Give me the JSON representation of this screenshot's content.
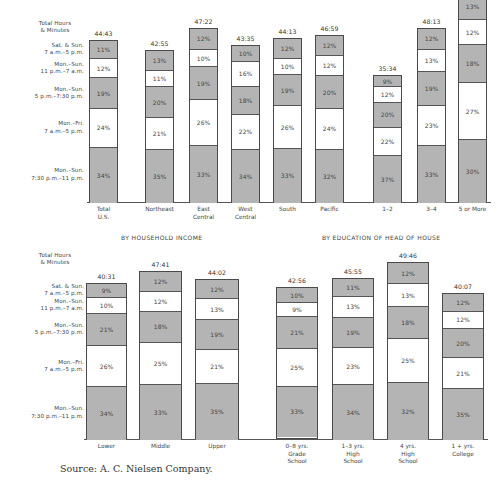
{
  "row_labels": {
    "header": [
      "Total Hours",
      "& Minutes"
    ],
    "segments": [
      [
        "Sat. & Sun.",
        "7 a.m.–5 p.m."
      ],
      [
        "Mon.–Sun.",
        "11 p.m.–7 a.m."
      ],
      [
        "Mon.–Sun.",
        "5 p.m.–7:30 p.m."
      ],
      [
        "Mon.–Fri.",
        "7 a.m.–5 p.m."
      ],
      [
        "Mon.–Sun.",
        "7:30 p.m.–11 p.m."
      ]
    ]
  },
  "sections": {
    "income": "BY HOUSEHOLD INCOME",
    "education": "BY EDUCATION OF HEAD OF HOUSE"
  },
  "source": "Source: A. C. Nielsen Company.",
  "chart_data": [
    {
      "type": "bar",
      "stacked": true,
      "title": "Television viewing hours by region and household size",
      "ylabel": "Total Hours & Minutes",
      "segment_order_top_to_bottom": [
        "Sat. & Sun. 7 a.m.–5 p.m.",
        "Mon.–Sun. 11 p.m.–7 a.m.",
        "Mon.–Sun. 5 p.m.–7:30 p.m.",
        "Mon.–Fri. 7 a.m.–5 p.m.",
        "Mon.–Sun. 7:30 p.m.–11 p.m."
      ],
      "categories": [
        "Total U.S.",
        "Northeast",
        "East Central",
        "West Central",
        "South",
        "Pacific",
        "1–2",
        "3–4",
        "5 or More"
      ],
      "totals": [
        "44:43",
        "42:55",
        "47:22",
        "43:35",
        "44:13",
        "46:59",
        "35:34",
        "48:13",
        ""
      ],
      "series": [
        {
          "name": "Sat. & Sun. 7 a.m.–5 p.m.",
          "values": [
            11,
            13,
            12,
            10,
            12,
            12,
            9,
            12,
            13
          ]
        },
        {
          "name": "Mon.–Sun. 11 p.m.–7 a.m.",
          "values": [
            12,
            11,
            10,
            16,
            10,
            12,
            12,
            13,
            12
          ]
        },
        {
          "name": "Mon.–Sun. 5 p.m.–7:30 p.m.",
          "values": [
            19,
            20,
            19,
            18,
            19,
            20,
            20,
            19,
            18
          ]
        },
        {
          "name": "Mon.–Fri. 7 a.m.–5 p.m.",
          "values": [
            24,
            21,
            26,
            22,
            26,
            24,
            22,
            23,
            27
          ]
        },
        {
          "name": "Mon.–Sun. 7:30 p.m.–11 p.m.",
          "values": [
            34,
            35,
            33,
            34,
            33,
            32,
            37,
            33,
            30
          ]
        }
      ],
      "colors": {
        "gray": "#b4b4b4",
        "white": "#ffffff"
      }
    },
    {
      "type": "bar",
      "stacked": true,
      "title": "Television viewing hours by household income and by education of head of house",
      "ylabel": "Total Hours & Minutes",
      "groups": {
        "BY HOUSEHOLD INCOME": [
          "Lower",
          "Middle",
          "Upper"
        ],
        "BY EDUCATION OF HEAD OF HOUSE": [
          "0–8 yrs. Grade School",
          "1–3 yrs. High School",
          "4 yrs. High School",
          "1 + yrs. College"
        ]
      },
      "categories": [
        "Lower",
        "Middle",
        "Upper",
        "0–8 yrs. Grade School",
        "1–3 yrs. High School",
        "4 yrs. High School",
        "1 + yrs. College"
      ],
      "totals": [
        "40:31",
        "47:41",
        "44:02",
        "42:56",
        "45:55",
        "49:46",
        "40:07"
      ],
      "series": [
        {
          "name": "Sat. & Sun. 7 a.m.–5 p.m.",
          "values": [
            9,
            12,
            12,
            10,
            11,
            12,
            12
          ]
        },
        {
          "name": "Mon.–Sun. 11 p.m.–7 a.m.",
          "values": [
            10,
            12,
            13,
            9,
            13,
            13,
            12
          ]
        },
        {
          "name": "Mon.–Sun. 5 p.m.–7:30 p.m.",
          "values": [
            21,
            18,
            19,
            21,
            19,
            18,
            20
          ]
        },
        {
          "name": "Mon.–Fri. 7 a.m.–5 p.m.",
          "values": [
            26,
            25,
            21,
            25,
            23,
            25,
            21
          ]
        },
        {
          "name": "Mon.–Sun. 7:30 p.m.–11 p.m.",
          "values": [
            34,
            33,
            35,
            33,
            34,
            32,
            35
          ]
        }
      ],
      "colors": {
        "gray": "#b4b4b4",
        "white": "#ffffff"
      }
    }
  ],
  "layout": {
    "top": {
      "baseline": 202,
      "bars": [
        {
          "x": 89,
          "w": 29,
          "top": 40,
          "label": [
            "Total",
            "U.S."
          ]
        },
        {
          "x": 145,
          "w": 29,
          "top": 50,
          "label": [
            "Northeast"
          ]
        },
        {
          "x": 189,
          "w": 29,
          "top": 28,
          "label": [
            "East",
            "Central"
          ]
        },
        {
          "x": 231,
          "w": 29,
          "top": 45,
          "label": [
            "West",
            "Central"
          ]
        },
        {
          "x": 273,
          "w": 29,
          "top": 38,
          "label": [
            "South"
          ]
        },
        {
          "x": 315,
          "w": 29,
          "top": 35,
          "label": [
            "Pacific"
          ]
        },
        {
          "x": 373,
          "w": 29,
          "top": 75,
          "label": [
            "1–2"
          ]
        },
        {
          "x": 417,
          "w": 29,
          "top": 28,
          "label": [
            "3–4"
          ]
        },
        {
          "x": 458,
          "w": 29,
          "top": -8,
          "label": [
            "5 or More"
          ]
        }
      ],
      "row_label_y": [
        37,
        52,
        66,
        92,
        148,
        177
      ],
      "row_label_header_y": 20
    },
    "bottom": {
      "baseline": 439,
      "bars": [
        {
          "x": 86,
          "w": 41,
          "top": 283,
          "label": [
            "Lower"
          ]
        },
        {
          "x": 139,
          "w": 43,
          "top": 271,
          "label": [
            "Middle"
          ]
        },
        {
          "x": 195,
          "w": 44,
          "top": 279,
          "label": [
            "Upper"
          ]
        },
        {
          "x": 276,
          "w": 42,
          "top": 287,
          "label": [
            "0–8 yrs.",
            "Grade",
            "School"
          ]
        },
        {
          "x": 332,
          "w": 42,
          "top": 278,
          "label": [
            "1–3 yrs.",
            "High",
            "School"
          ]
        },
        {
          "x": 387,
          "w": 42,
          "top": 262,
          "label": [
            "4 yrs.",
            "High",
            "School"
          ]
        },
        {
          "x": 442,
          "w": 42,
          "top": 293,
          "label": [
            "1 + yrs.",
            "College"
          ]
        }
      ],
      "row_label_header_y": 252
    }
  }
}
